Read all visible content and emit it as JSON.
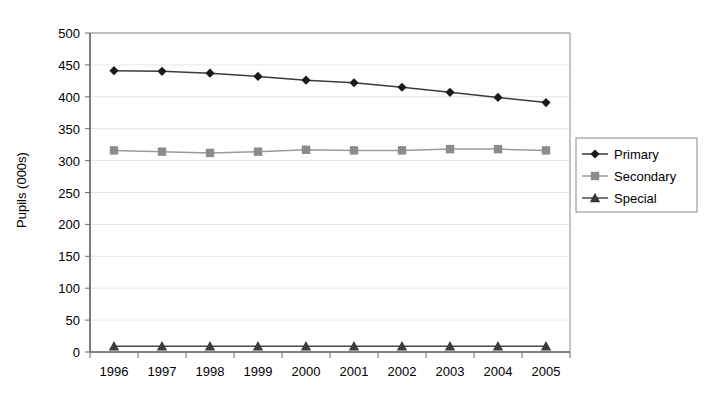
{
  "chart_data": {
    "type": "line",
    "title": "",
    "subtitle": "",
    "xlabel": "",
    "ylabel": "Pupils (000s)",
    "categories": [
      "1996",
      "1997",
      "1998",
      "1999",
      "2000",
      "2001",
      "2002",
      "2003",
      "2004",
      "2005"
    ],
    "series": [
      {
        "name": "Primary",
        "marker": "diamond",
        "color": "#1a1a1a",
        "line_color": "#3b3b3b",
        "values": [
          441,
          440,
          437,
          432,
          426,
          422,
          415,
          407,
          399,
          391
        ]
      },
      {
        "name": "Secondary",
        "marker": "square",
        "color": "#8c8c8c",
        "line_color": "#9a9a9a",
        "values": [
          316,
          314,
          312,
          314,
          317,
          316,
          316,
          318,
          318,
          316
        ]
      },
      {
        "name": "Special",
        "marker": "triangle",
        "color": "#3a3a3a",
        "line_color": "#4a4a4a",
        "values": [
          9,
          9,
          9,
          9,
          9,
          9,
          9,
          9,
          9,
          9
        ]
      }
    ],
    "ylim": [
      0,
      500
    ],
    "ytick_step": 50,
    "yticks": [
      "0",
      "50",
      "100",
      "150",
      "200",
      "250",
      "300",
      "350",
      "400",
      "450",
      "500"
    ],
    "grid": true,
    "grid_color": "#e6e6e6",
    "axis_color": "#6b6b6b",
    "plot_border_color": "#8a8a8a",
    "legend_position": "right",
    "legend_border_color": "#8a8a8a",
    "background": "#ffffff"
  },
  "legend": {
    "entries": [
      {
        "label": "Primary"
      },
      {
        "label": "Secondary"
      },
      {
        "label": "Special"
      }
    ]
  },
  "axes": {
    "y_title": "Pupils (000s)"
  }
}
